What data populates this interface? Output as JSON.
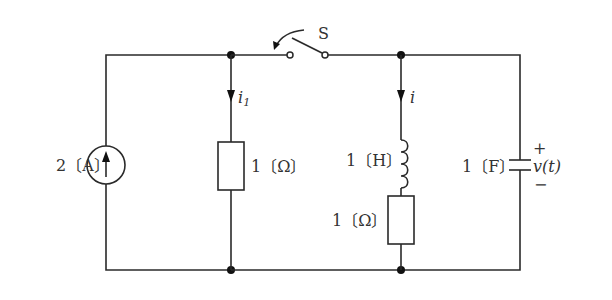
{
  "diagram": {
    "type": "electrical-circuit",
    "switch": {
      "label": "S",
      "state": "open"
    },
    "current_source": {
      "value_label": "2〔A〕",
      "direction": "up"
    },
    "branch1": {
      "current_label": "i",
      "current_subscript": "1",
      "resistor_label": "1〔Ω〕"
    },
    "branch2": {
      "current_label": "i",
      "inductor_label": "1〔H〕",
      "resistor_label": "1〔Ω〕"
    },
    "capacitor": {
      "value_label": "1〔F〕",
      "voltage_label": "v(t)",
      "plus_sign": "+",
      "minus_sign": "−"
    }
  }
}
